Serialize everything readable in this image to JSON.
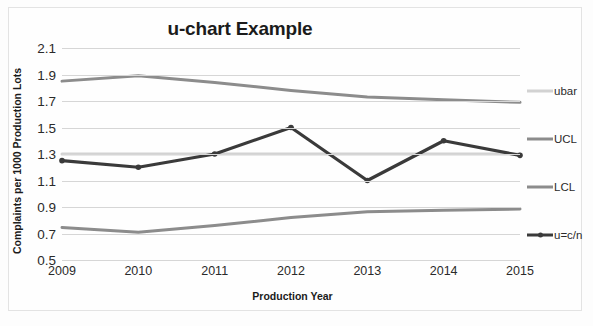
{
  "chart_data": {
    "type": "line",
    "title": "u-chart Example",
    "xlabel": "Production Year",
    "ylabel": "Complaints per 1000 Production Lots",
    "categories": [
      "2009",
      "2010",
      "2011",
      "2012",
      "2013",
      "2014",
      "2015"
    ],
    "ytick_labels": [
      "2.1",
      "1.9",
      "1.7",
      "1.5",
      "1.3",
      "1.1",
      "0.9",
      "0.7",
      "0.5"
    ],
    "ylim": [
      0.5,
      2.1
    ],
    "ystep": 0.2,
    "grid": true,
    "legend_position": "right",
    "series": [
      {
        "name": "ubar",
        "color": "#d2d2d2",
        "width": 3,
        "marker": false,
        "values": [
          1.3,
          1.3,
          1.3,
          1.3,
          1.3,
          1.3,
          1.3
        ]
      },
      {
        "name": "UCL",
        "color": "#8c8c8c",
        "width": 3,
        "marker": false,
        "values": [
          1.85,
          1.89,
          1.84,
          1.78,
          1.73,
          1.71,
          1.69
        ]
      },
      {
        "name": "LCL",
        "color": "#8c8c8c",
        "width": 3,
        "marker": false,
        "values": [
          0.745,
          0.71,
          0.76,
          0.82,
          0.865,
          0.875,
          0.885
        ]
      },
      {
        "name": "u=c/n",
        "color": "#3a3a3a",
        "width": 3.2,
        "marker": true,
        "values": [
          1.25,
          1.2,
          1.3,
          1.5,
          1.1,
          1.4,
          1.29
        ]
      }
    ]
  },
  "legend": {
    "items": [
      {
        "label": "ubar"
      },
      {
        "label": "UCL"
      },
      {
        "label": "LCL"
      },
      {
        "label": "u=c/n"
      }
    ]
  }
}
